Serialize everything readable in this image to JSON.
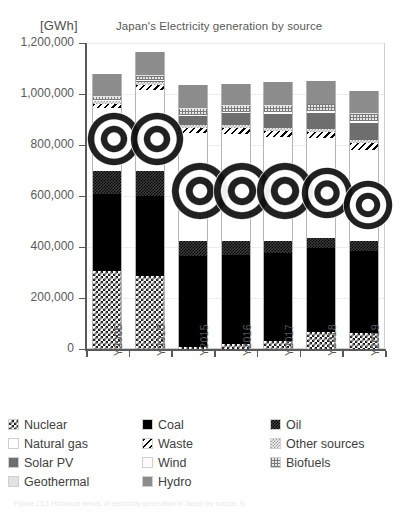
{
  "header": {
    "unit_label": "[GWh]",
    "title": "Japan's Electricity generation by source"
  },
  "caption": "Figure 13.1 Historical trends of electricity generation in Japan by source. S",
  "legend": {
    "rows": [
      [
        {
          "label": "Nuclear",
          "pattern": "checker-black-white",
          "color": "#1a1a1a"
        },
        {
          "label": "Coal",
          "pattern": "solid",
          "color": "#000000"
        },
        {
          "label": "Oil",
          "pattern": "fine-checker-dark",
          "color": "#3d3d3d"
        }
      ],
      [
        {
          "label": "Natural gas",
          "pattern": "dotted-center",
          "color": "#ffffff"
        },
        {
          "label": "Waste",
          "pattern": "diagonal-hatch",
          "color": "#000000"
        },
        {
          "label": "Other sources",
          "pattern": "light-checker",
          "color": "#bfbfbf"
        }
      ],
      [
        {
          "label": "Solar PV",
          "pattern": "solid",
          "color": "#6e6e6e"
        },
        {
          "label": "Wind",
          "pattern": "solid",
          "color": "#fbfbfb"
        },
        {
          "label": "Biofuels",
          "pattern": "grid-light",
          "color": "#d9d9d9"
        }
      ],
      [
        {
          "label": "Geothermal",
          "pattern": "solid",
          "color": "#e2e2e2"
        },
        {
          "label": "Hydro",
          "pattern": "solid",
          "color": "#8c8c8c"
        }
      ]
    ]
  },
  "axis": {
    "y_ticks": [
      "0",
      "200,000",
      "400,000",
      "600,000",
      "800,000",
      "1,000,000",
      "1,200,000"
    ],
    "x_ticks": [
      "Y2005",
      "Y2010",
      "Y2015",
      "Y2016",
      "Y2017",
      "Y2018",
      "Y2019"
    ]
  },
  "chart_data": {
    "type": "bar",
    "stacked": true,
    "title": "Japan's Electricity generation by source",
    "xlabel": "",
    "ylabel": "[GWh]",
    "ylim": [
      0,
      1200000
    ],
    "ytick_step": 200000,
    "grid": true,
    "legend_position": "below",
    "categories": [
      "Y2005",
      "Y2010",
      "Y2015",
      "Y2016",
      "Y2017",
      "Y2018",
      "Y2019"
    ],
    "series": [
      {
        "name": "Nuclear",
        "values": [
          304000,
          288000,
          9400,
          18000,
          31000,
          65000,
          64000
        ]
      },
      {
        "name": "Coal",
        "values": [
          304000,
          312000,
          357000,
          350000,
          347000,
          331000,
          322000
        ]
      },
      {
        "name": "Oil",
        "values": [
          92000,
          98000,
          56000,
          54000,
          47000,
          38000,
          39000
        ]
      },
      {
        "name": "Natural gas",
        "values": [
          244000,
          319000,
          424000,
          423000,
          407000,
          395000,
          357000
        ]
      },
      {
        "name": "Waste",
        "values": [
          17000,
          18000,
          22000,
          23000,
          24000,
          24000,
          25000
        ]
      },
      {
        "name": "Other sources",
        "values": [
          11000,
          12000,
          11000,
          11000,
          11000,
          11000,
          11000
        ]
      },
      {
        "name": "Solar PV",
        "values": [
          1400,
          3800,
          35000,
          45000,
          55000,
          63000,
          69000
        ]
      },
      {
        "name": "Wind",
        "values": [
          1800,
          4000,
          5200,
          6200,
          6500,
          7500,
          7700
        ]
      },
      {
        "name": "Biofuels",
        "values": [
          13000,
          17000,
          22000,
          24000,
          25000,
          26000,
          27000
        ]
      },
      {
        "name": "Geothermal",
        "values": [
          3200,
          2600,
          2600,
          2500,
          2500,
          2500,
          2500
        ]
      },
      {
        "name": "Hydro",
        "values": [
          86000,
          90000,
          91000,
          82000,
          90000,
          87000,
          86000
        ]
      }
    ]
  },
  "watermark": {
    "name": "concentric-ring-stamp",
    "count": 7
  }
}
